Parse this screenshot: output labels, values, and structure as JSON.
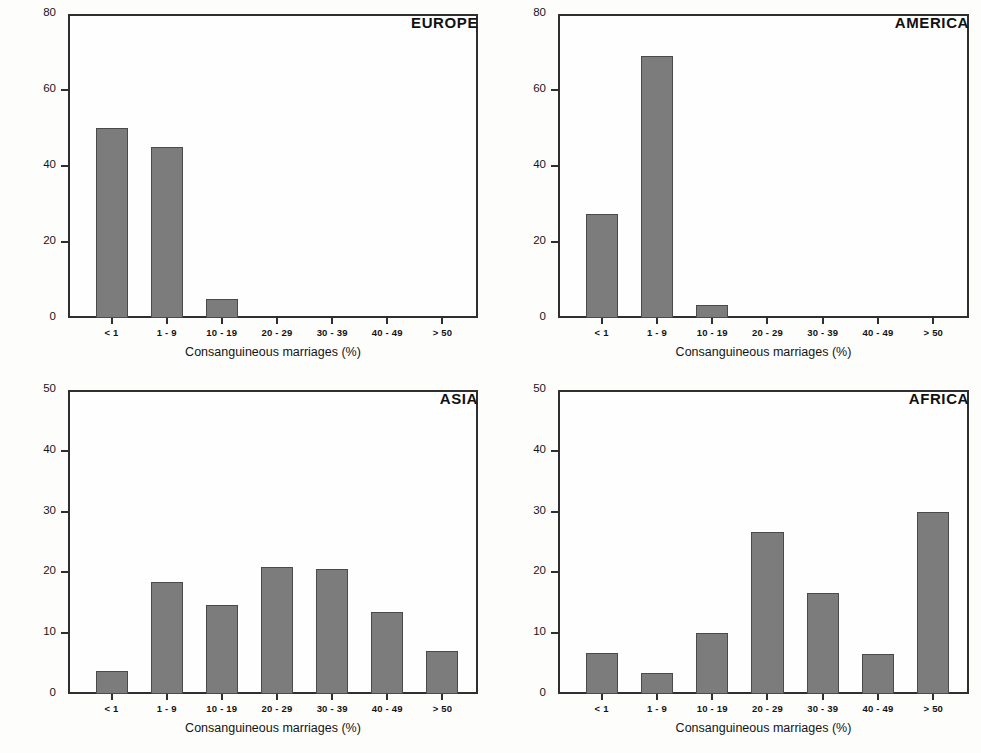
{
  "chart_data": [
    {
      "type": "bar",
      "title": "EUROPE",
      "xlabel": "Consanguineous marriages (%)",
      "ylabel": "Number of populations (%)",
      "categories": [
        "< 1",
        "1 - 9",
        "10 - 19",
        "20 - 29",
        "30 - 39",
        "40 - 49",
        "> 50"
      ],
      "values": [
        50,
        45,
        5,
        0,
        0,
        0,
        0
      ],
      "ylim": [
        0,
        80
      ],
      "yticks": [
        0,
        20,
        40,
        60,
        80
      ],
      "grid": false,
      "legend": "none",
      "bar_color": "#7c7c7c",
      "bar_edge_color": "#4a4a4a"
    },
    {
      "type": "bar",
      "title": "AMERICA",
      "xlabel": "Consanguineous marriages (%)",
      "ylabel": "",
      "categories": [
        "< 1",
        "1 - 9",
        "10 - 19",
        "20 - 29",
        "30 - 39",
        "40 - 49",
        "> 50"
      ],
      "values": [
        27.5,
        69,
        3.5,
        0,
        0,
        0,
        0
      ],
      "ylim": [
        0,
        80
      ],
      "yticks": [
        0,
        20,
        40,
        60,
        80
      ],
      "grid": false,
      "legend": "none",
      "bar_color": "#7c7c7c",
      "bar_edge_color": "#4a4a4a"
    },
    {
      "type": "bar",
      "title": "ASIA",
      "xlabel": "Consanguineous marriages (%)",
      "ylabel": "Number of populations (%)",
      "categories": [
        "< 1",
        "1 - 9",
        "10 - 19",
        "20 - 29",
        "30 - 39",
        "40 - 49",
        "> 50"
      ],
      "values": [
        3.8,
        18.5,
        14.6,
        20.9,
        20.5,
        13.5,
        7.0
      ],
      "ylim": [
        0,
        50
      ],
      "yticks": [
        0,
        10,
        20,
        30,
        40,
        50
      ],
      "grid": false,
      "legend": "none",
      "bar_color": "#7c7c7c",
      "bar_edge_color": "#4a4a4a"
    },
    {
      "type": "bar",
      "title": "AFRICA",
      "xlabel": "Consanguineous marriages (%)",
      "ylabel": "",
      "categories": [
        "< 1",
        "1 - 9",
        "10 - 19",
        "20 - 29",
        "30 - 39",
        "40 - 49",
        "> 50"
      ],
      "values": [
        6.7,
        3.4,
        10.0,
        26.6,
        16.6,
        6.6,
        29.9
      ],
      "ylim": [
        0,
        50
      ],
      "yticks": [
        0,
        10,
        20,
        30,
        40,
        50
      ],
      "grid": false,
      "legend": "none",
      "bar_color": "#7c7c7c",
      "bar_edge_color": "#4a4a4a"
    }
  ]
}
